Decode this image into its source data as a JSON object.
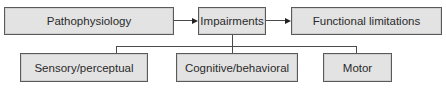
{
  "diagram": {
    "top_row": [
      {
        "id": "pathophysiology",
        "label": "Pathophysiology"
      },
      {
        "id": "impairments",
        "label": "Impairments"
      },
      {
        "id": "functional-limitations",
        "label": "Functional limitations"
      }
    ],
    "bottom_row": [
      {
        "id": "sensory-perceptual",
        "label": "Sensory/perceptual"
      },
      {
        "id": "cognitive-behavioral",
        "label": "Cognitive/behavioral"
      },
      {
        "id": "motor",
        "label": "Motor"
      }
    ],
    "edges": [
      {
        "from": "pathophysiology",
        "to": "impairments",
        "type": "arrow"
      },
      {
        "from": "impairments",
        "to": "functional-limitations",
        "type": "arrow"
      },
      {
        "from": "impairments",
        "to": "sensory-perceptual",
        "type": "line"
      },
      {
        "from": "impairments",
        "to": "cognitive-behavioral",
        "type": "line"
      },
      {
        "from": "impairments",
        "to": "motor",
        "type": "line"
      }
    ],
    "colors": {
      "box_fill": "#e3e3e3",
      "box_border": "#5a5a5a",
      "line": "#4a4a4a"
    }
  }
}
